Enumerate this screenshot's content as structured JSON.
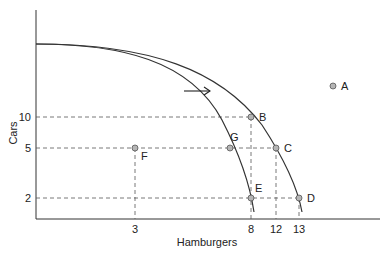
{
  "axes": {
    "y_label": "Cars",
    "x_label": "Hamburgers",
    "y_ticks": [
      {
        "label": "10",
        "y": 117
      },
      {
        "label": "5",
        "y": 148
      },
      {
        "label": "2",
        "y": 198
      }
    ],
    "x_ticks": [
      {
        "label": "3",
        "x": 135
      },
      {
        "label": "8",
        "x": 251
      },
      {
        "label": "12",
        "x": 276
      },
      {
        "label": "13",
        "x": 299
      }
    ]
  },
  "points": [
    {
      "id": "A",
      "x": 333,
      "y": 86
    },
    {
      "id": "B",
      "x": 251,
      "y": 117
    },
    {
      "id": "C",
      "x": 276,
      "y": 148
    },
    {
      "id": "D",
      "x": 299,
      "y": 198
    },
    {
      "id": "E",
      "x": 251,
      "y": 198
    },
    {
      "id": "F",
      "x": 135,
      "y": 148
    },
    {
      "id": "G",
      "x": 230,
      "y": 148
    }
  ],
  "curves": {
    "inner": "original PPF",
    "outer": "shifted PPF"
  },
  "arrow": "shift-right",
  "colors": {
    "line": "#333333",
    "point_fill": "#b5b5b5",
    "dash": "#555555"
  }
}
